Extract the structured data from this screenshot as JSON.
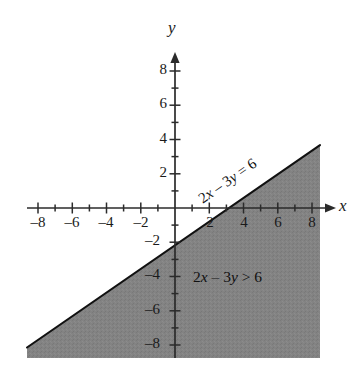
{
  "figure": {
    "background_color": "#ffffff",
    "shade_color": "#808080",
    "line_color": "#111111",
    "axis_color": "#333333"
  },
  "axes": {
    "x_axis_label": "x",
    "y_axis_label": "y",
    "x_ticks_negative": [
      "–8",
      "–6",
      "–4",
      "–2"
    ],
    "x_ticks_positive": [
      "2",
      "4",
      "6",
      "8"
    ],
    "y_ticks_positive": [
      "8",
      "6",
      "4",
      "2"
    ],
    "y_ticks_negative": [
      "–2",
      "–4",
      "–6",
      "–8"
    ]
  },
  "annotations": {
    "line_equation": "2x – 3y = 6",
    "inequality": "2x – 3y > 6"
  },
  "chart_data": {
    "type": "line",
    "title": "",
    "xlabel": "x",
    "ylabel": "y",
    "xlim": [
      -9,
      9
    ],
    "ylim": [
      -9,
      9
    ],
    "xticks": [
      -8,
      -6,
      -4,
      -2,
      2,
      4,
      6,
      8
    ],
    "yticks": [
      -8,
      -6,
      -4,
      -2,
      2,
      4,
      6,
      8
    ],
    "minor_tick_step": 1,
    "grid": false,
    "legend": "none",
    "series": [
      {
        "name": "2x - 3y = 6",
        "type": "line",
        "style": "solid",
        "slope": 0.6666666667,
        "intercept": -2,
        "x_intercept": 3,
        "y_intercept": -2,
        "points": [
          [
            -8,
            -7.333
          ],
          [
            8,
            3.333
          ]
        ],
        "label": "2x – 3y = 6"
      },
      {
        "name": "2x - 3y > 6",
        "type": "region",
        "fill": "#808080",
        "description": "Region below the line 2x - 3y = 6 is shaded",
        "label": "2x – 3y > 6"
      }
    ]
  }
}
